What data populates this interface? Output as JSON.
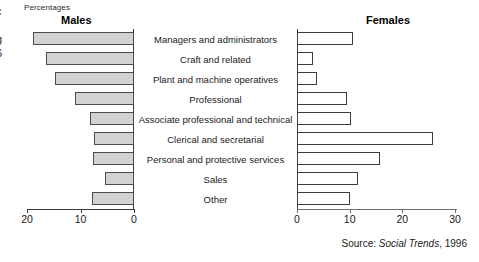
{
  "axis_unit_label": "Percentages",
  "panels": {
    "males": {
      "title": "Males"
    },
    "females": {
      "title": "Females"
    }
  },
  "edge_artifacts": [
    "c",
    "r",
    "g",
    "6"
  ],
  "source": {
    "prefix": "Source: ",
    "publication": "Social Trends",
    "suffix": ", 1996"
  },
  "males_axis": {
    "ticks": [
      {
        "value": 20,
        "label": "20"
      },
      {
        "value": 10,
        "label": "10"
      },
      {
        "value": 0,
        "label": "0"
      }
    ]
  },
  "females_axis": {
    "ticks": [
      {
        "value": 0,
        "label": "0"
      },
      {
        "value": 10,
        "label": "10"
      },
      {
        "value": 20,
        "label": "20"
      },
      {
        "value": 30,
        "label": "30"
      }
    ]
  },
  "chart_data": {
    "type": "bar",
    "title": "Percentages",
    "subtitle": "",
    "xlabel": "Percentages",
    "ylabel": "",
    "orientation": "horizontal",
    "layout": "population-pyramid",
    "grid": false,
    "legend_position": "none",
    "categories": [
      "Managers and administrators",
      "Craft and related",
      "Plant and machine operatives",
      "Professional",
      "Associate professional and technical",
      "Clerical and secretarial",
      "Personal and protective services",
      "Sales",
      "Other"
    ],
    "series": [
      {
        "name": "Males",
        "direction": "left",
        "axis_range": [
          0,
          20
        ],
        "axis_reversed": true,
        "values": [
          18.8,
          16.4,
          14.7,
          11.1,
          8.3,
          7.5,
          7.7,
          5.5,
          7.9
        ]
      },
      {
        "name": "Females",
        "direction": "right",
        "axis_range": [
          0,
          30
        ],
        "axis_reversed": false,
        "values": [
          10.7,
          3.0,
          3.8,
          9.5,
          10.3,
          25.9,
          15.8,
          11.6,
          10.1
        ]
      }
    ],
    "source": "Source: Social Trends, 1996"
  }
}
